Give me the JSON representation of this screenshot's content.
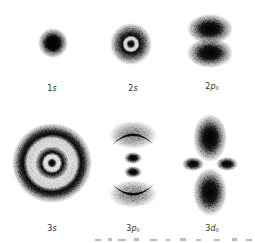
{
  "figure": {
    "orbitals": [
      {
        "id": "1s",
        "n": "1",
        "letter": "s",
        "sub": "",
        "cx": 53,
        "cy": 43,
        "label_x": 52,
        "label_y": 84
      },
      {
        "id": "2s",
        "n": "2",
        "letter": "s",
        "sub": "",
        "cx": 131,
        "cy": 44,
        "label_x": 133,
        "label_y": 84
      },
      {
        "id": "2p0",
        "n": "2",
        "letter": "p",
        "sub": "0",
        "cx": 210,
        "cy": 40,
        "label_x": 212,
        "label_y": 82
      },
      {
        "id": "3s",
        "n": "3",
        "letter": "s",
        "sub": "",
        "cx": 52,
        "cy": 165,
        "label_x": 52,
        "label_y": 224
      },
      {
        "id": "3p0",
        "n": "3",
        "letter": "p",
        "sub": "0",
        "cx": 133,
        "cy": 165,
        "label_x": 133,
        "label_y": 224
      },
      {
        "id": "3d0",
        "n": "3",
        "letter": "d",
        "sub": "0",
        "cx": 210,
        "cy": 165,
        "label_x": 212,
        "label_y": 224
      }
    ]
  },
  "labels": {
    "l1s": {
      "n": "1",
      "l": "s",
      "sub": ""
    },
    "l2s": {
      "n": "2",
      "l": "s",
      "sub": ""
    },
    "l2p0": {
      "n": "2",
      "l": "p",
      "sub": "0"
    },
    "l3s": {
      "n": "3",
      "l": "s",
      "sub": ""
    },
    "l3p0": {
      "n": "3",
      "l": "p",
      "sub": "0"
    },
    "l3d0": {
      "n": "3",
      "l": "d",
      "sub": "0"
    }
  },
  "colors": {
    "ink": "#111111",
    "background": "#ffffff",
    "label": "#333333"
  }
}
